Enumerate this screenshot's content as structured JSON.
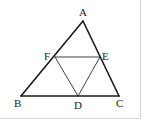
{
  "figure": {
    "vertices": {
      "A": {
        "label": "A"
      },
      "B": {
        "label": "B"
      },
      "C": {
        "label": "C"
      },
      "D": {
        "label": "D"
      },
      "E": {
        "label": "E"
      },
      "F": {
        "label": "F"
      }
    },
    "outer_triangle": [
      "A",
      "B",
      "C"
    ],
    "inner_segments": [
      [
        "F",
        "E"
      ],
      [
        "F",
        "D"
      ],
      [
        "E",
        "D"
      ]
    ],
    "point_on_side": {
      "F": [
        "A",
        "B"
      ],
      "E": [
        "A",
        "C"
      ],
      "D": [
        "B",
        "C"
      ]
    },
    "colors": {
      "stroke": "#1a1a1a",
      "text": "#222222",
      "border": "#d6d6d6"
    }
  }
}
